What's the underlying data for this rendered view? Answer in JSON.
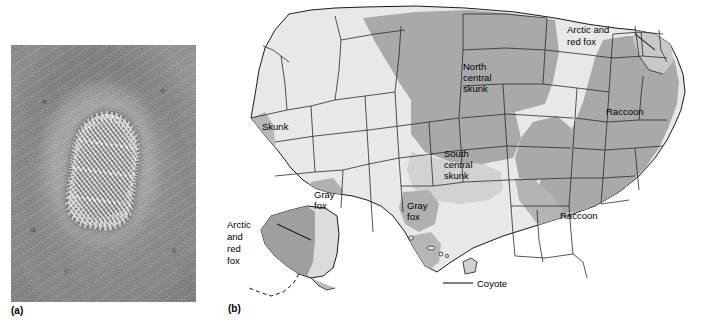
{
  "figure": {
    "panels": [
      {
        "id": "a",
        "label": "(a)",
        "type": "electron-micrograph",
        "subject": "rabies virion",
        "description": "Negative-stain electron micrograph of a single bullet-shaped rabies virus particle surrounded by a dark stain halo"
      },
      {
        "id": "b",
        "label": "(b)",
        "type": "choropleth-map",
        "subject": "United States distribution of terrestrial rabies reservoir species"
      }
    ]
  },
  "map": {
    "title": "",
    "shading": {
      "dark_gray": "#a9a9a9",
      "mid_gray": "#bdbdbd",
      "light_gray": "#dcdcdc",
      "unshaded": "#e8e8e8",
      "outline": "#1a1a1a",
      "background": "#ffffff"
    },
    "labels": [
      {
        "id": "skunk-west",
        "text": "Skunk",
        "lines": [
          "Skunk"
        ],
        "x": 47,
        "y": 130,
        "leader": false
      },
      {
        "id": "north-central-skunk",
        "text": "North central skunk",
        "lines": [
          "North",
          "central",
          "skunk"
        ],
        "x": 248,
        "y": 70,
        "leader": false
      },
      {
        "id": "south-central-skunk",
        "text": "South central skunk",
        "lines": [
          "South",
          "central",
          "skunk"
        ],
        "x": 229,
        "y": 157,
        "leader": false
      },
      {
        "id": "gray-fox-arizona",
        "text": "Gray fox",
        "lines": [
          "Gray",
          "fox"
        ],
        "x": 109,
        "y": 194,
        "leader": false
      },
      {
        "id": "gray-fox-texas",
        "text": "Gray fox",
        "lines": [
          "Gray",
          "fox"
        ],
        "x": 201,
        "y": 206,
        "leader": false
      },
      {
        "id": "arctic-red-fox-alaska",
        "text": "Arctic and red fox",
        "lines": [
          "Arctic",
          "and",
          "red",
          "fox"
        ],
        "x": 18,
        "y": 228,
        "leader": true
      },
      {
        "id": "arctic-red-fox-northeast",
        "text": "Arctic and red fox",
        "lines": [
          "Arctic and",
          "red fox"
        ],
        "x": 373,
        "y": 32,
        "leader": true
      },
      {
        "id": "raccoon-northeast",
        "text": "Raccoon",
        "lines": [
          "Raccoon"
        ],
        "x": 392,
        "y": 112,
        "leader": false
      },
      {
        "id": "raccoon-southeast",
        "text": "Raccoon",
        "lines": [
          "Raccoon"
        ],
        "x": 355,
        "y": 216,
        "leader": false
      },
      {
        "id": "coyote-texas",
        "text": "Coyote",
        "lines": [
          "Coyote"
        ],
        "x": 265,
        "y": 285,
        "leader": true
      }
    ],
    "reservoir_species": [
      "Skunk",
      "North central skunk",
      "South central skunk",
      "Gray fox",
      "Arctic and red fox",
      "Raccoon",
      "Coyote"
    ]
  }
}
